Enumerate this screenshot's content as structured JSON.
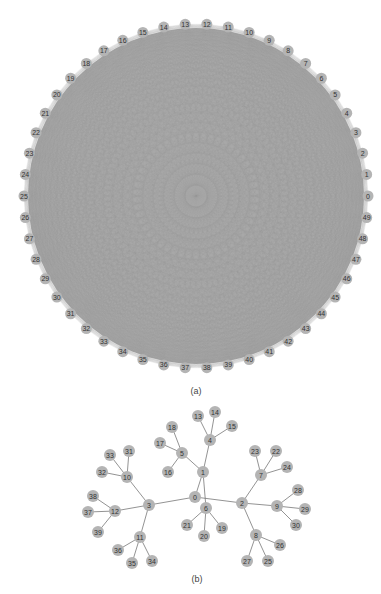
{
  "figure_a": {
    "caption": "(a)",
    "node_count": 50,
    "labels": [
      "0",
      "1",
      "2",
      "3",
      "4",
      "5",
      "6",
      "7",
      "8",
      "9",
      "10",
      "11",
      "12",
      "13",
      "14",
      "15",
      "16",
      "17",
      "18",
      "19",
      "20",
      "21",
      "22",
      "23",
      "24",
      "25",
      "26",
      "27",
      "28",
      "29",
      "30",
      "31",
      "32",
      "33",
      "34",
      "35",
      "36",
      "37",
      "38",
      "39",
      "40",
      "41",
      "42",
      "43",
      "44",
      "45",
      "46",
      "47",
      "48",
      "49"
    ],
    "layout": "circular, complete graph",
    "center": [
      196,
      196
    ],
    "radius": 172,
    "colors": {
      "edge": "#9a9a9a",
      "node": "#b4b4b4",
      "label": "#333333",
      "fill_disk": "#a8a8a8"
    }
  },
  "figure_b": {
    "caption": "(b)",
    "layout": "tree",
    "nodes": [
      {
        "id": "0",
        "x": 195,
        "y": 497
      },
      {
        "id": "1",
        "x": 203,
        "y": 472
      },
      {
        "id": "2",
        "x": 242,
        "y": 503
      },
      {
        "id": "3",
        "x": 149,
        "y": 505
      },
      {
        "id": "4",
        "x": 210,
        "y": 440
      },
      {
        "id": "5",
        "x": 182,
        "y": 453
      },
      {
        "id": "6",
        "x": 206,
        "y": 508
      },
      {
        "id": "7",
        "x": 261,
        "y": 475
      },
      {
        "id": "8",
        "x": 256,
        "y": 535
      },
      {
        "id": "9",
        "x": 277,
        "y": 506
      },
      {
        "id": "10",
        "x": 127,
        "y": 477
      },
      {
        "id": "11",
        "x": 140,
        "y": 537
      },
      {
        "id": "12",
        "x": 115,
        "y": 511
      },
      {
        "id": "13",
        "x": 198,
        "y": 416
      },
      {
        "id": "14",
        "x": 215,
        "y": 412
      },
      {
        "id": "15",
        "x": 232,
        "y": 426
      },
      {
        "id": "16",
        "x": 168,
        "y": 472
      },
      {
        "id": "17",
        "x": 160,
        "y": 443
      },
      {
        "id": "18",
        "x": 172,
        "y": 427
      },
      {
        "id": "19",
        "x": 222,
        "y": 528
      },
      {
        "id": "20",
        "x": 204,
        "y": 536
      },
      {
        "id": "21",
        "x": 187,
        "y": 525
      },
      {
        "id": "22",
        "x": 276,
        "y": 451
      },
      {
        "id": "23",
        "x": 255,
        "y": 451
      },
      {
        "id": "24",
        "x": 287,
        "y": 467
      },
      {
        "id": "25",
        "x": 268,
        "y": 561
      },
      {
        "id": "26",
        "x": 280,
        "y": 545
      },
      {
        "id": "27",
        "x": 247,
        "y": 561
      },
      {
        "id": "28",
        "x": 298,
        "y": 490
      },
      {
        "id": "29",
        "x": 305,
        "y": 509
      },
      {
        "id": "30",
        "x": 296,
        "y": 525
      },
      {
        "id": "31",
        "x": 129,
        "y": 451
      },
      {
        "id": "32",
        "x": 102,
        "y": 472
      },
      {
        "id": "33",
        "x": 110,
        "y": 455
      },
      {
        "id": "34",
        "x": 152,
        "y": 561
      },
      {
        "id": "35",
        "x": 132,
        "y": 563
      },
      {
        "id": "36",
        "x": 118,
        "y": 550
      },
      {
        "id": "37",
        "x": 88,
        "y": 512
      },
      {
        "id": "38",
        "x": 93,
        "y": 496
      },
      {
        "id": "39",
        "x": 98,
        "y": 532
      }
    ],
    "edges": [
      [
        "0",
        "1"
      ],
      [
        "0",
        "2"
      ],
      [
        "0",
        "3"
      ],
      [
        "1",
        "6"
      ],
      [
        "1",
        "4"
      ],
      [
        "1",
        "5"
      ],
      [
        "4",
        "13"
      ],
      [
        "4",
        "14"
      ],
      [
        "4",
        "15"
      ],
      [
        "5",
        "16"
      ],
      [
        "5",
        "17"
      ],
      [
        "5",
        "18"
      ],
      [
        "6",
        "19"
      ],
      [
        "6",
        "20"
      ],
      [
        "6",
        "21"
      ],
      [
        "2",
        "7"
      ],
      [
        "2",
        "8"
      ],
      [
        "2",
        "9"
      ],
      [
        "7",
        "22"
      ],
      [
        "7",
        "23"
      ],
      [
        "7",
        "24"
      ],
      [
        "8",
        "25"
      ],
      [
        "8",
        "26"
      ],
      [
        "8",
        "27"
      ],
      [
        "9",
        "28"
      ],
      [
        "9",
        "29"
      ],
      [
        "9",
        "30"
      ],
      [
        "3",
        "10"
      ],
      [
        "3",
        "11"
      ],
      [
        "3",
        "12"
      ],
      [
        "10",
        "31"
      ],
      [
        "10",
        "32"
      ],
      [
        "10",
        "33"
      ],
      [
        "11",
        "34"
      ],
      [
        "11",
        "35"
      ],
      [
        "11",
        "36"
      ],
      [
        "12",
        "37"
      ],
      [
        "12",
        "38"
      ],
      [
        "12",
        "39"
      ]
    ],
    "colors": {
      "edge": "#777777",
      "node": "#b4b4b4",
      "label": "#333333"
    }
  }
}
